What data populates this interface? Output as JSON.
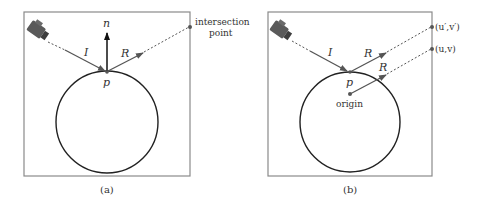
{
  "figure": {
    "panel_a": {
      "caption": "(a)",
      "labels": {
        "normal": "n",
        "incident": "I",
        "reflected": "R",
        "point": "p",
        "intersection_line1": "intersection",
        "intersection_line2": "point"
      }
    },
    "panel_b": {
      "caption": "(b)",
      "labels": {
        "incident": "I",
        "reflected_from_p": "R",
        "reflected_from_origin": "R",
        "point": "p",
        "origin": "origin",
        "uv_prime": "(u′,v′)",
        "uv": "(u,v)"
      }
    },
    "colors": {
      "frame": "#8a8a8a",
      "stroke": "#222222",
      "arrow": "#555555",
      "camera": "#555555"
    }
  }
}
